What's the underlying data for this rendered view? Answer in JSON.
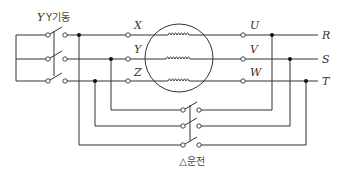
{
  "diagram": {
    "labels": {
      "y_start": "Y기동",
      "delta_run": "△운전",
      "motor_start_terminals": [
        "X",
        "Y",
        "Z"
      ],
      "motor_end_terminals": [
        "U",
        "V",
        "W"
      ],
      "supply_lines": [
        "R",
        "S",
        "T"
      ]
    },
    "components": {
      "y_switch": "3-pole switch for Y starting",
      "delta_switch": "3-pole switch for Δ running",
      "motor": "three-phase motor with three windings"
    },
    "colors": {
      "line": "#333333",
      "background": "#ffffff"
    }
  }
}
